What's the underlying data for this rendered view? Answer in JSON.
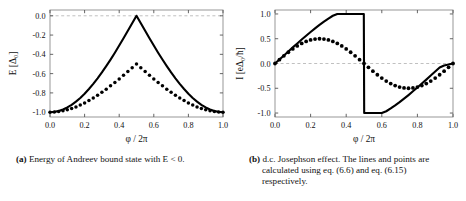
{
  "figure": {
    "panel_a": {
      "caption_label": "(a)",
      "caption_text": "Energy of Andreev bound state with E < 0."
    },
    "panel_b": {
      "caption_label": "(b)",
      "caption_text": "d.c. Josephson effect. The lines and points are calculated using eq. (6.6) and eq. (6.15) respectively."
    }
  },
  "chart_data": [
    {
      "type": "line",
      "panel": "a",
      "title": "",
      "xlabel": "φ / 2π",
      "ylabel": "E [Δ₀]",
      "xlim": [
        0.0,
        1.0
      ],
      "ylim": [
        -1.05,
        0.06
      ],
      "xticks": [
        0.0,
        0.2,
        0.4,
        0.6,
        0.8,
        1.0
      ],
      "xticklabels": [
        "0.0",
        "0.2",
        "0.4",
        "0.6",
        "0.8",
        "1.0"
      ],
      "yticks": [
        0.0,
        -0.2,
        -0.4,
        -0.6,
        -0.8,
        -1.0
      ],
      "yticklabels": [
        "0.0",
        "-0.2",
        "-0.4",
        "-0.6",
        "-0.8",
        "-1.0"
      ],
      "grid": false,
      "legend": "none",
      "reference_line_y": 0.0,
      "series": [
        {
          "name": "solid-line",
          "style": "solid",
          "x": [
            0.0,
            0.025,
            0.05,
            0.075,
            0.1,
            0.125,
            0.15,
            0.175,
            0.2,
            0.225,
            0.25,
            0.275,
            0.3,
            0.325,
            0.35,
            0.375,
            0.4,
            0.425,
            0.45,
            0.475,
            0.5,
            0.525,
            0.55,
            0.575,
            0.6,
            0.625,
            0.65,
            0.675,
            0.7,
            0.725,
            0.75,
            0.775,
            0.8,
            0.825,
            0.85,
            0.875,
            0.9,
            0.925,
            0.95,
            0.975,
            1.0
          ],
          "y": [
            -1.0,
            -0.997,
            -0.988,
            -0.972,
            -0.951,
            -0.924,
            -0.891,
            -0.853,
            -0.809,
            -0.76,
            -0.707,
            -0.649,
            -0.588,
            -0.522,
            -0.454,
            -0.383,
            -0.309,
            -0.233,
            -0.156,
            -0.078,
            0.0,
            -0.078,
            -0.156,
            -0.233,
            -0.309,
            -0.383,
            -0.454,
            -0.522,
            -0.588,
            -0.649,
            -0.707,
            -0.76,
            -0.809,
            -0.853,
            -0.891,
            -0.924,
            -0.951,
            -0.972,
            -0.988,
            -0.997,
            -1.0
          ]
        },
        {
          "name": "dotted-points",
          "style": "dotted",
          "x": [
            0.0,
            0.025,
            0.05,
            0.075,
            0.1,
            0.125,
            0.15,
            0.175,
            0.2,
            0.225,
            0.25,
            0.275,
            0.3,
            0.325,
            0.35,
            0.375,
            0.4,
            0.425,
            0.45,
            0.475,
            0.5,
            0.525,
            0.55,
            0.575,
            0.6,
            0.625,
            0.65,
            0.675,
            0.7,
            0.725,
            0.75,
            0.775,
            0.8,
            0.825,
            0.85,
            0.875,
            0.9,
            0.925,
            0.95,
            0.975,
            1.0
          ],
          "y": [
            -1.0,
            -0.9985,
            -0.9938,
            -0.986,
            -0.9755,
            -0.962,
            -0.9455,
            -0.9265,
            -0.9045,
            -0.88,
            -0.8535,
            -0.8245,
            -0.794,
            -0.761,
            -0.727,
            -0.6915,
            -0.6545,
            -0.617,
            -0.578,
            -0.539,
            -0.5,
            -0.539,
            -0.578,
            -0.617,
            -0.6545,
            -0.6915,
            -0.727,
            -0.761,
            -0.794,
            -0.8245,
            -0.8535,
            -0.88,
            -0.9045,
            -0.9265,
            -0.9455,
            -0.962,
            -0.9755,
            -0.986,
            -0.9938,
            -0.9985,
            -1.0
          ]
        }
      ]
    },
    {
      "type": "line",
      "panel": "b",
      "title": "",
      "xlabel": "φ / 2π",
      "ylabel": "I [eΔ₀/ħ]",
      "xlim": [
        0.0,
        1.0
      ],
      "ylim": [
        -1.08,
        1.08
      ],
      "xticks": [
        0.0,
        0.2,
        0.4,
        0.6,
        0.8,
        1.0
      ],
      "xticklabels": [
        "0.0",
        "0.2",
        "0.4",
        "0.6",
        "0.8",
        "1.0"
      ],
      "yticks": [
        1.0,
        0.5,
        0.0,
        -0.5,
        -1.0
      ],
      "yticklabels": [
        "1.0",
        "0.5",
        "0.0",
        "-0.5",
        "-1.0"
      ],
      "grid": false,
      "legend": "none",
      "reference_line_y": 0.0,
      "discontinuity_x": 0.5,
      "series": [
        {
          "name": "solid-line",
          "style": "solid",
          "x": [
            0.0,
            0.025,
            0.05,
            0.075,
            0.1,
            0.125,
            0.15,
            0.175,
            0.2,
            0.225,
            0.25,
            0.275,
            0.3,
            0.325,
            0.35,
            0.375,
            0.4,
            0.425,
            0.45,
            0.475,
            0.499,
            0.501,
            0.525,
            0.55,
            0.575,
            0.6,
            0.625,
            0.65,
            0.675,
            0.7,
            0.725,
            0.75,
            0.775,
            0.8,
            0.825,
            0.85,
            0.875,
            0.9,
            0.925,
            0.95,
            0.975,
            1.0
          ],
          "y": [
            0.0,
            0.081,
            0.163,
            0.244,
            0.325,
            0.405,
            0.484,
            0.561,
            0.637,
            0.71,
            0.78,
            0.846,
            0.908,
            0.964,
            1.0,
            1.0,
            1.0,
            1.0,
            1.0,
            1.0,
            1.0,
            -1.0,
            -1.0,
            -1.0,
            -1.0,
            -1.0,
            -0.964,
            -0.908,
            -0.846,
            -0.78,
            -0.71,
            -0.637,
            -0.561,
            -0.484,
            -0.405,
            -0.325,
            -0.244,
            -0.163,
            -0.081,
            -0.04,
            -0.02,
            0.0
          ]
        },
        {
          "name": "dotted-points",
          "style": "dotted",
          "x": [
            0.0,
            0.025,
            0.05,
            0.075,
            0.1,
            0.125,
            0.15,
            0.175,
            0.2,
            0.225,
            0.25,
            0.275,
            0.3,
            0.325,
            0.35,
            0.375,
            0.4,
            0.425,
            0.45,
            0.475,
            0.5,
            0.525,
            0.55,
            0.575,
            0.6,
            0.625,
            0.65,
            0.675,
            0.7,
            0.725,
            0.75,
            0.775,
            0.8,
            0.825,
            0.85,
            0.875,
            0.9,
            0.925,
            0.95,
            0.975,
            1.0
          ],
          "y": [
            0.0,
            0.078,
            0.155,
            0.227,
            0.294,
            0.354,
            0.405,
            0.446,
            0.476,
            0.494,
            0.5,
            0.494,
            0.476,
            0.446,
            0.405,
            0.354,
            0.294,
            0.227,
            0.155,
            0.078,
            0.0,
            -0.078,
            -0.155,
            -0.227,
            -0.294,
            -0.354,
            -0.405,
            -0.446,
            -0.476,
            -0.494,
            -0.5,
            -0.494,
            -0.476,
            -0.446,
            -0.405,
            -0.354,
            -0.294,
            -0.227,
            -0.155,
            -0.078,
            0.0
          ]
        }
      ]
    }
  ]
}
